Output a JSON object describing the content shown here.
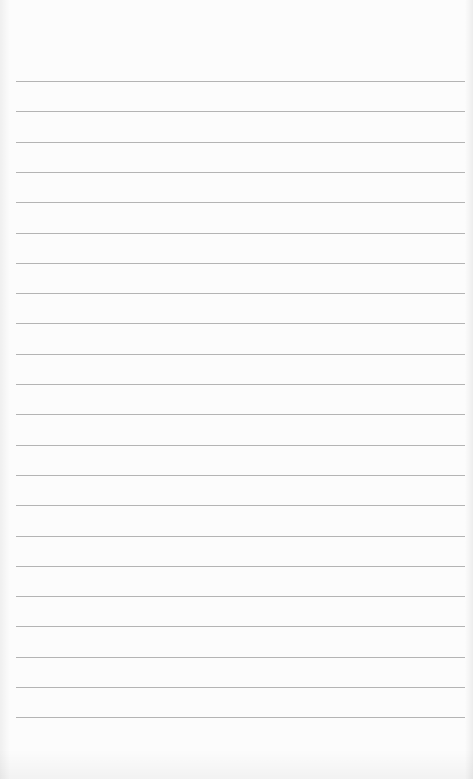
{
  "page": {
    "type": "lined-paper",
    "background_color": "#fcfcfc",
    "line_color": "#b4b4b4",
    "line_count": 22,
    "first_line_y": 81,
    "line_spacing": 30.3,
    "line_left": 16,
    "line_width": 449
  }
}
